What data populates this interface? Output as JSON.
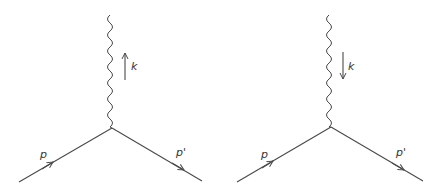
{
  "diagrams": [
    {
      "name": "vertex-absorption",
      "incoming_label": "p",
      "outgoing_label": "p'",
      "photon_label": "k",
      "photon_arrow_direction": "up"
    },
    {
      "name": "vertex-emission",
      "incoming_label": "p",
      "outgoing_label": "p'",
      "photon_label": "k",
      "photon_arrow_direction": "down"
    }
  ],
  "colors": {
    "line": "#4a4a4a",
    "text": "#333333"
  }
}
